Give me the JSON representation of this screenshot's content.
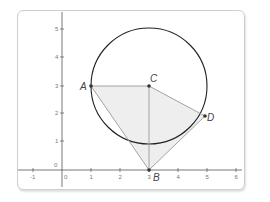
{
  "diagram": {
    "type": "coordinate-geometry",
    "x_axis": {
      "ticks": [
        "-1",
        "0",
        "1",
        "2",
        "3",
        "4",
        "5",
        "6"
      ]
    },
    "y_axis": {
      "ticks": [
        "0",
        "1",
        "2",
        "3",
        "4",
        "5"
      ]
    },
    "points": {
      "A": {
        "label": "A",
        "x": 1,
        "y": 3
      },
      "B": {
        "label": "B",
        "x": 3,
        "y": 0
      },
      "C": {
        "label": "C",
        "x": 3,
        "y": 3
      },
      "D": {
        "label": "D",
        "x": 4.9,
        "y": 1.9
      }
    },
    "circle": {
      "center": "C",
      "radius": 2
    },
    "shaded_polygon": [
      "A",
      "C",
      "D",
      "B"
    ],
    "segments": [
      [
        "A",
        "C"
      ],
      [
        "C",
        "D"
      ],
      [
        "C",
        "B"
      ],
      [
        "A",
        "B"
      ],
      [
        "D",
        "B"
      ]
    ],
    "colors": {
      "axis": "#555555",
      "circle": "#222222",
      "segment": "#9a9a9a",
      "fill": "#eeeeee",
      "point": "#333333"
    }
  }
}
